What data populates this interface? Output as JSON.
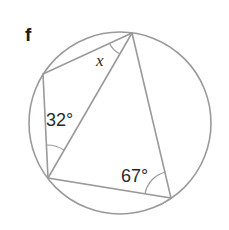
{
  "problem_label": "f",
  "diagram": {
    "type": "cyclic-quadrilateral-in-circle",
    "circle": {
      "cx": 120,
      "cy": 123,
      "r": 91
    },
    "vertices": {
      "top": [
        132,
        33
      ],
      "left_upper": [
        43,
        74
      ],
      "left_lower": [
        48,
        178
      ],
      "right_lower": [
        171,
        198
      ]
    },
    "angles": {
      "x": {
        "label": "x",
        "at": "top",
        "between": "left_upper-diagonal"
      },
      "a32": {
        "label": "32°",
        "at": "left_lower",
        "between": "left_upper-diagonal"
      },
      "a67": {
        "label": "67°",
        "at": "right_lower",
        "between": "left_lower-top"
      }
    },
    "stroke_color": "#9a9a9a",
    "text_color": "#2a2a2a"
  }
}
